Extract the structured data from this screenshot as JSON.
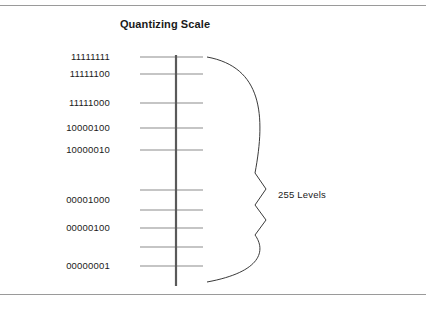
{
  "figure": {
    "title": "Quantizing Scale",
    "brace_label": "255 Levels"
  },
  "chart_data": {
    "type": "scale-diagram",
    "title": "Quantizing Scale",
    "xlabel": "",
    "ylabel": "",
    "annotations": [
      "255 Levels"
    ],
    "axis": {
      "orientation": "vertical",
      "color": "#5a5a5a",
      "top_y": 55,
      "bottom_y": 286
    },
    "tick_color": "#8c8c8c",
    "ticks": [
      {
        "label": "11111111",
        "y": 57,
        "labeled": true
      },
      {
        "label": "11111100",
        "y": 74,
        "labeled": true
      },
      {
        "label": "11111000",
        "y": 103,
        "labeled": true
      },
      {
        "label": "10000100",
        "y": 128,
        "labeled": true
      },
      {
        "label": "10000010",
        "y": 150,
        "labeled": true
      },
      {
        "label": "",
        "y": 190,
        "labeled": false
      },
      {
        "label": "00001000",
        "y": 210,
        "labeled": true
      },
      {
        "label": "00000100",
        "y": 228,
        "labeled": true
      },
      {
        "label": "",
        "y": 247,
        "labeled": false
      },
      {
        "label": "00000001",
        "y": 266,
        "labeled": true
      }
    ],
    "labels": [
      {
        "text": "11111111",
        "y": 57
      },
      {
        "text": "11111100",
        "y": 74
      },
      {
        "text": "11111000",
        "y": 103
      },
      {
        "text": "10000100",
        "y": 128
      },
      {
        "text": "10000010",
        "y": 150
      },
      {
        "text": "00001000",
        "y": 200
      },
      {
        "text": "00000100",
        "y": 228
      },
      {
        "text": "00000001",
        "y": 266
      }
    ],
    "brace": {
      "label": "255 Levels",
      "top_y": 57,
      "bottom_y": 282,
      "mid_y": 195,
      "left_x": 207,
      "right_x": 266,
      "color": "#3a3a3a"
    },
    "frame_rules": [
      {
        "position": "top",
        "y": 5
      },
      {
        "position": "bottom",
        "y": 294
      }
    ]
  }
}
